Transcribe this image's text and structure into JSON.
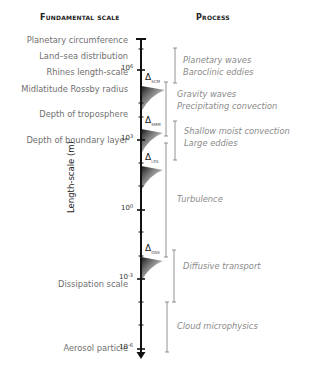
{
  "headers": {
    "left": "Fundamental scale",
    "right": "Process"
  },
  "axis": {
    "label": "Length-scale (m)",
    "tick_labels": [
      {
        "base": "10",
        "exp": "6",
        "y": 70
      },
      {
        "base": "10",
        "exp": "3",
        "y": 140
      },
      {
        "base": "10",
        "exp": "0",
        "y": 210
      },
      {
        "base": "10",
        "exp": "-3",
        "y": 279
      },
      {
        "base": "10",
        "exp": "-6",
        "y": 349
      }
    ]
  },
  "fundamental_scales": [
    {
      "label": "Planetary circumference",
      "y": 40
    },
    {
      "label": "Land–sea distribution",
      "y": 58
    },
    {
      "label": "Rhines length-scale",
      "y": 72
    },
    {
      "label": "Midlatitude Rossby radius",
      "y": 89
    },
    {
      "label": "Depth of troposphere",
      "y": 115
    },
    {
      "label": "Depth of boundary layer",
      "y": 140
    },
    {
      "label": "Dissipation scale",
      "y": 282
    },
    {
      "label": "Aerosol particle",
      "y": 350
    }
  ],
  "model_markers": [
    {
      "symbol": "Δ",
      "sub": "SCM",
      "y": 85
    },
    {
      "symbol": "Δ",
      "sub": "SMM",
      "y": 128
    },
    {
      "symbol": "Δ",
      "sub": "LES",
      "y": 165
    },
    {
      "symbol": "Δ",
      "sub": "DNS",
      "y": 256
    }
  ],
  "processes": [
    {
      "lines": [
        "Planetary waves",
        "Baroclinic eddies"
      ]
    },
    {
      "lines": [
        "Gravity waves",
        "Precipitating convection"
      ]
    },
    {
      "lines": [
        "Shallow moist convection",
        "Large eddies"
      ]
    },
    {
      "lines": [
        "Turbulence"
      ]
    },
    {
      "lines": [
        "Diffusive transport"
      ]
    },
    {
      "lines": [
        "Cloud microphysics"
      ]
    }
  ]
}
